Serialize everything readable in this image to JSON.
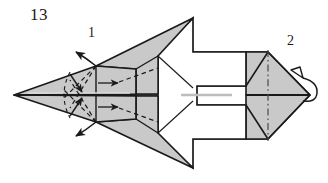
{
  "figure": {
    "kind": "origami-folding-diagram",
    "step_number": "13",
    "labels": [
      {
        "id": "part-1",
        "text": "1"
      },
      {
        "id": "part-2",
        "text": "2"
      }
    ],
    "icons": {
      "fold_arrow_upper_left": "curved-arrow-up-left-icon",
      "fold_arrow_lower_left": "curved-arrow-down-left-icon",
      "fold_behind_arrow_right": "hollow-curved-fold-behind-arrow-icon"
    },
    "colors": {
      "paper_shaded": "#c9c9c9",
      "paper_shaded_dark": "#b9b9b9",
      "paper_white": "#ffffff",
      "outline": "#1a1a1a",
      "crease_dashed": "#1a1a1a",
      "crease_dashdot": "#555555",
      "background": "#ffffff",
      "label_text": "#1a1a1a"
    },
    "crease_styles": {
      "outline": "solid",
      "valley_fold": "dashed",
      "axis_fold": "dash-dot"
    },
    "geometry_notes": {
      "left_tip": "14,95",
      "right_tip": "310,95",
      "top_apex": "193,18",
      "bottom_apex": "193,168",
      "center_axis_y": "95"
    }
  }
}
